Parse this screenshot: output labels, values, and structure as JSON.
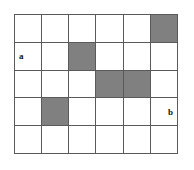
{
  "diagram": {
    "columns": 6,
    "rows": 5,
    "background_color": "#ffffff",
    "grid_line_color": "#5a5a5a",
    "shaded_color": "#808080",
    "empty_color": "#ffffff",
    "cells": [
      [
        {
          "shaded": false,
          "label": ""
        },
        {
          "shaded": false,
          "label": ""
        },
        {
          "shaded": false,
          "label": ""
        },
        {
          "shaded": false,
          "label": ""
        },
        {
          "shaded": false,
          "label": ""
        },
        {
          "shaded": true,
          "label": ""
        }
      ],
      [
        {
          "shaded": false,
          "label": "a"
        },
        {
          "shaded": false,
          "label": ""
        },
        {
          "shaded": true,
          "label": ""
        },
        {
          "shaded": false,
          "label": ""
        },
        {
          "shaded": false,
          "label": ""
        },
        {
          "shaded": false,
          "label": ""
        }
      ],
      [
        {
          "shaded": false,
          "label": ""
        },
        {
          "shaded": false,
          "label": ""
        },
        {
          "shaded": false,
          "label": ""
        },
        {
          "shaded": true,
          "label": ""
        },
        {
          "shaded": true,
          "label": ""
        },
        {
          "shaded": false,
          "label": ""
        }
      ],
      [
        {
          "shaded": false,
          "label": ""
        },
        {
          "shaded": true,
          "label": ""
        },
        {
          "shaded": false,
          "label": ""
        },
        {
          "shaded": false,
          "label": ""
        },
        {
          "shaded": false,
          "label": ""
        },
        {
          "shaded": false,
          "label": "b"
        }
      ],
      [
        {
          "shaded": false,
          "label": ""
        },
        {
          "shaded": false,
          "label": ""
        },
        {
          "shaded": false,
          "label": ""
        },
        {
          "shaded": false,
          "label": ""
        },
        {
          "shaded": false,
          "label": ""
        },
        {
          "shaded": false,
          "label": ""
        }
      ]
    ],
    "labels": {
      "a": "a",
      "b": "b"
    }
  }
}
